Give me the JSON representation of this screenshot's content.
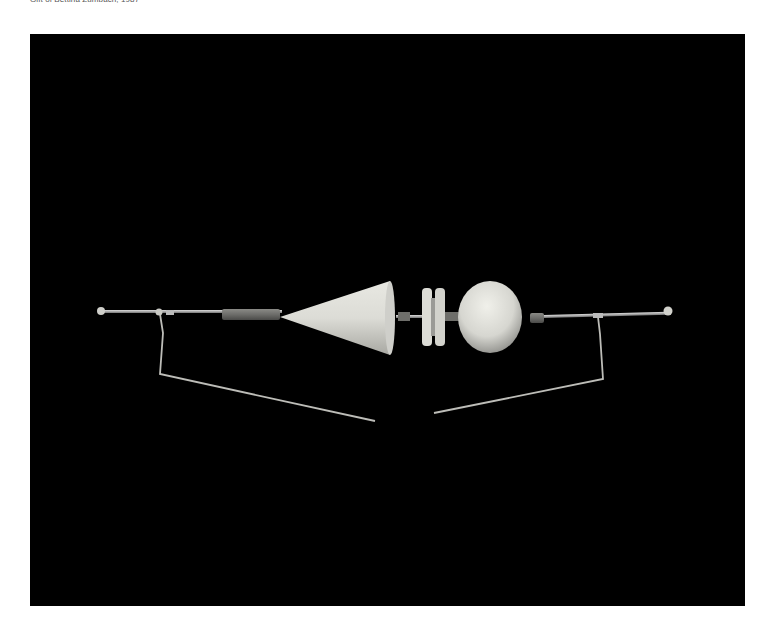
{
  "caption": "Gift of Bettina Zumbach, 1987",
  "photo": {
    "subject": "kinetic-sculpture",
    "background_color": "#000000",
    "elements": [
      "left-wire-arm",
      "left-rod",
      "cone",
      "pulley-disc",
      "sphere",
      "right-rod",
      "right-wire-arm"
    ]
  }
}
